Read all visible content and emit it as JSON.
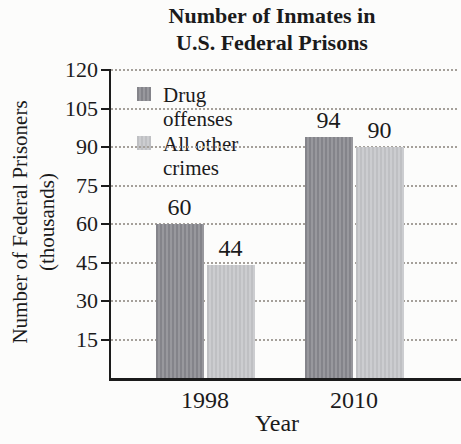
{
  "title": {
    "line1": "Number of Inmates in",
    "line2": "U.S. Federal Prisons"
  },
  "y_axis": {
    "label_line1": "Number of Federal Prisoners",
    "label_line2": "(thousands)"
  },
  "x_axis": {
    "label": "Year"
  },
  "legend": {
    "items": [
      {
        "label": "Drug offenses",
        "swatch": "dark"
      },
      {
        "label": "All other crimes",
        "swatch": "light"
      }
    ]
  },
  "colors": {
    "text": "#1b1b1b",
    "axis": "#1b1b1b",
    "gridline": "#a5a09a",
    "bar_dark_a": "#84848a",
    "bar_dark_b": "#98989d",
    "bar_light_a": "#bfc0c3",
    "bar_light_b": "#cccdd0"
  },
  "chart_data": {
    "type": "bar",
    "title": "Number of Inmates in U.S. Federal Prisons",
    "categories": [
      "1998",
      "2010"
    ],
    "series": [
      {
        "name": "Drug offenses",
        "values": [
          60,
          94
        ]
      },
      {
        "name": "All other crimes",
        "values": [
          44,
          90
        ]
      }
    ],
    "xlabel": "Year",
    "ylabel": "Number of Federal Prisoners (thousands)",
    "yticks": [
      15,
      30,
      45,
      60,
      75,
      90,
      105,
      120
    ],
    "ylim": [
      0,
      120
    ],
    "grid": "horizontal-dotted",
    "legend_position": "top-left",
    "bar_value_labels": [
      60,
      44,
      94,
      90
    ]
  }
}
